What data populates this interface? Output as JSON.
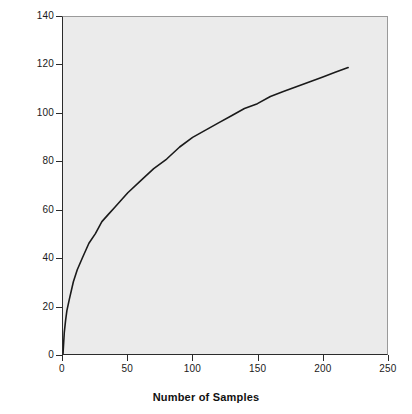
{
  "chart_data": {
    "type": "line",
    "title": "",
    "subtitle": "",
    "xlabel": "Number of Samples",
    "ylabel": "Number of Species",
    "xlim": [
      0,
      250
    ],
    "ylim": [
      0,
      140
    ],
    "xticks": [
      0,
      50,
      100,
      150,
      200,
      250
    ],
    "yticks": [
      0,
      20,
      40,
      60,
      80,
      100,
      120,
      140
    ],
    "xtick_labels": [
      "0",
      "50",
      "100",
      "150",
      "200",
      "250"
    ],
    "ytick_labels": [
      "0",
      "20",
      "40",
      "60",
      "80",
      "100",
      "120",
      "140"
    ],
    "grid": false,
    "legend": null,
    "legend_position": "none",
    "annotations": [],
    "background_color": "#ebebeb",
    "line_color": "#1a1a1a",
    "line_width": 1.6,
    "series": [
      {
        "name": "Species accumulation curve",
        "x": [
          0,
          1,
          2,
          3,
          5,
          8,
          11,
          15,
          20,
          25,
          30,
          35,
          40,
          45,
          50,
          60,
          70,
          80,
          90,
          100,
          110,
          120,
          130,
          140,
          150,
          160,
          170,
          180,
          190,
          200,
          210,
          220
        ],
        "y": [
          0,
          9,
          14,
          18,
          23,
          30,
          35,
          40,
          46,
          50,
          55,
          58,
          61,
          64,
          67,
          72,
          77,
          81,
          86,
          90,
          93,
          96,
          99,
          102,
          104,
          107,
          109,
          111,
          113,
          115,
          117,
          119
        ]
      }
    ]
  },
  "axes": {
    "x_title": "Number of Samples",
    "y_title": "Number of Species"
  }
}
